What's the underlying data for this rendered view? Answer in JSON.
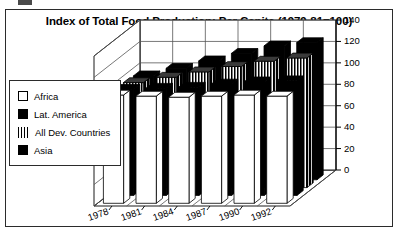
{
  "chart_data": {
    "type": "bar",
    "title": "Index of Total Food Production: Per Capita (1979-81=100)",
    "xlabel": "",
    "ylabel": "",
    "ylim": [
      0,
      140
    ],
    "yticks": [
      0,
      20,
      40,
      60,
      80,
      100,
      120,
      140
    ],
    "grid": true,
    "projection": "3d",
    "legend_position": "left",
    "categories": [
      "1978",
      "1981",
      "1984",
      "1987",
      "1990",
      "1992"
    ],
    "series": [
      {
        "name": "Africa",
        "swatch": "white",
        "values": [
          101,
          100,
          99,
          100,
          101,
          100
        ]
      },
      {
        "name": "Lat. America",
        "swatch": "black",
        "values": [
          99,
          100,
          101,
          104,
          106,
          107
        ]
      },
      {
        "name": "All Dev. Countries",
        "swatch": "stripe",
        "values": [
          98,
          103,
          108,
          113,
          118,
          121
        ]
      },
      {
        "name": "Asia",
        "swatch": "black",
        "values": [
          97,
          104,
          111,
          118,
          125,
          128
        ]
      }
    ]
  },
  "colors": {
    "ink": "#000000",
    "frame": "#2b2b2b",
    "grid": "#555555",
    "white_bar": "#ffffff",
    "black_bar": "#000000"
  }
}
